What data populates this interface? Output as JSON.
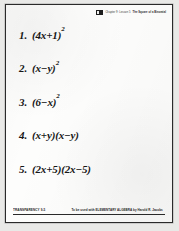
{
  "document": {
    "type": "overhead-transparency-worksheet",
    "header": {
      "logo_icon": "publisher-logo-icon",
      "course_label": "Chapter 9: Lesson 5",
      "topic_label": "The Square of a Binomial"
    },
    "problems": [
      {
        "number": "1.",
        "base": "(4x+1)",
        "exponent": "2",
        "full": "(4x+1)²"
      },
      {
        "number": "2.",
        "base": "(x−y)",
        "exponent": "2",
        "full": "(x−y)²"
      },
      {
        "number": "3.",
        "base": "(6−x)",
        "exponent": "2",
        "full": "(6−x)²"
      },
      {
        "number": "4.",
        "base": "(x+y)(x−y)",
        "exponent": "",
        "full": "(x+y)(x−y)"
      },
      {
        "number": "5.",
        "base": "(2x+5)(2x−5)",
        "exponent": "",
        "full": "(2x+5)(2x−5)"
      }
    ],
    "footer": {
      "transparency_id": "TRANSPARENCY 9-5",
      "attribution": "To be used with ELEMENTARY ALGEBRA by Harold R. Jacobs"
    }
  },
  "colors": {
    "page": "#fdfdfc",
    "surround": "#e9e9e7",
    "ink": "#161616",
    "rule": "#2a2a2a"
  }
}
